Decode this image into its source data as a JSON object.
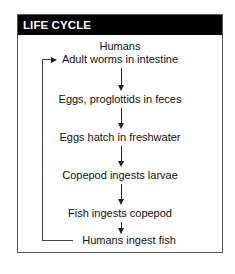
{
  "panel": {
    "title": "LIFE CYCLE",
    "header_bg": "#000000",
    "header_fg": "#ffffff"
  },
  "diagram": {
    "type": "cyclic-flow",
    "host_label": "Humans",
    "steps": [
      "Adult worms in intestine",
      "Eggs, proglottids in feces",
      "Eggs hatch in freshwater",
      "Copepod ingests larvae",
      "Fish ingests copepod",
      "Humans ingest fish"
    ],
    "loop": {
      "from": "Humans ingest fish",
      "to": "Adult worms in intestine"
    }
  }
}
